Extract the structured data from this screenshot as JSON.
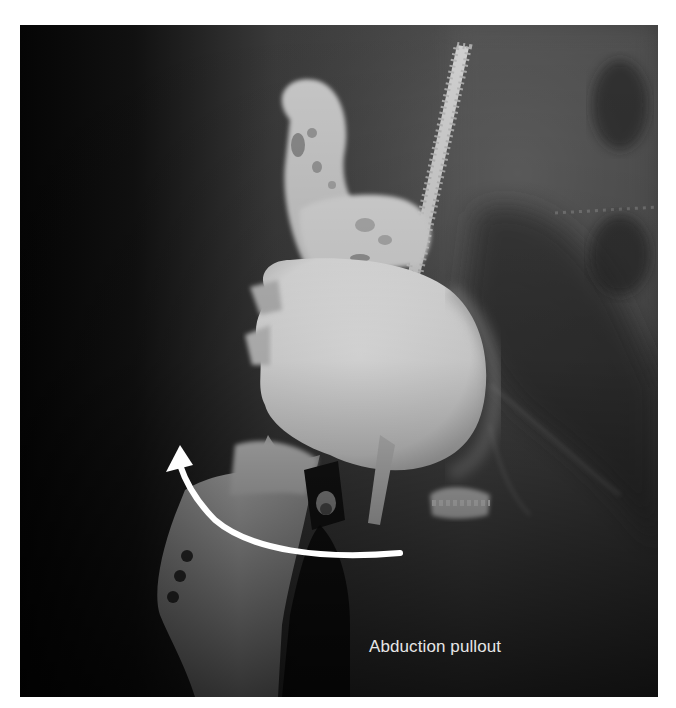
{
  "figure": {
    "type": "radiograph",
    "caption_label": "Abduction pullout",
    "annotation": {
      "arrow_direction": "curved, pointing up-left",
      "arrow_color": "#ffffff"
    },
    "colors": {
      "background": "#ffffff",
      "film_dark": "#0c0c0c",
      "bone_mid": "#8a8a8a",
      "implant_bright": "#f0f0f0",
      "caption_text": "#e6e6e6"
    }
  }
}
